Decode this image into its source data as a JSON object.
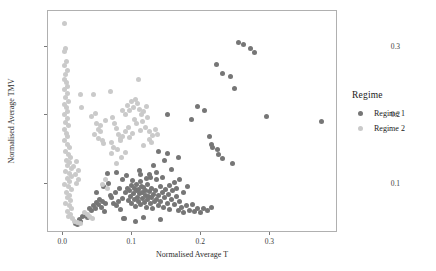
{
  "chart_data": {
    "type": "scatter",
    "title": "",
    "xlabel": "Normalised Average T",
    "ylabel": "Normalised Average TMV",
    "xlim": [
      -0.022,
      0.398
    ],
    "ylim": [
      0.028,
      0.352
    ],
    "xticks": [
      "0.0",
      "0.1",
      "0.2",
      "0.3"
    ],
    "xtick_values": [
      0.0,
      0.1,
      0.2,
      0.3
    ],
    "yticks": [
      "0.1",
      "0.2",
      "0.3"
    ],
    "ytick_values": [
      0.1,
      0.2,
      0.3
    ],
    "grid": false,
    "legend": {
      "title": "Regime",
      "position": "right",
      "entries": [
        {
          "label": "Regime 1",
          "color": "#767676"
        },
        {
          "label": "Regime 2",
          "color": "#cacaca"
        }
      ]
    },
    "series": [
      {
        "name": "Regime 1",
        "color": "#767676",
        "points": [
          [
            0.019,
            0.041
          ],
          [
            0.022,
            0.039
          ],
          [
            0.025,
            0.046
          ],
          [
            0.027,
            0.044
          ],
          [
            0.03,
            0.05
          ],
          [
            0.033,
            0.052
          ],
          [
            0.036,
            0.049
          ],
          [
            0.04,
            0.063
          ],
          [
            0.043,
            0.06
          ],
          [
            0.046,
            0.066
          ],
          [
            0.048,
            0.062
          ],
          [
            0.05,
            0.071
          ],
          [
            0.052,
            0.068
          ],
          [
            0.054,
            0.075
          ],
          [
            0.057,
            0.064
          ],
          [
            0.059,
            0.073
          ],
          [
            0.061,
            0.058
          ],
          [
            0.063,
            0.069
          ],
          [
            0.065,
            0.114
          ],
          [
            0.067,
            0.099
          ],
          [
            0.07,
            0.082
          ],
          [
            0.072,
            0.078
          ],
          [
            0.074,
            0.07
          ],
          [
            0.077,
            0.085
          ],
          [
            0.079,
            0.066
          ],
          [
            0.081,
            0.073
          ],
          [
            0.083,
            0.091
          ],
          [
            0.085,
            0.061
          ],
          [
            0.087,
            0.077
          ],
          [
            0.089,
            0.047
          ],
          [
            0.091,
            0.086
          ],
          [
            0.093,
            0.11
          ],
          [
            0.095,
            0.092
          ],
          [
            0.096,
            0.074
          ],
          [
            0.098,
            0.088
          ],
          [
            0.099,
            0.08
          ],
          [
            0.1,
            0.096
          ],
          [
            0.101,
            0.07
          ],
          [
            0.102,
            0.103
          ],
          [
            0.103,
            0.084
          ],
          [
            0.104,
            0.076
          ],
          [
            0.105,
            0.092
          ],
          [
            0.106,
            0.065
          ],
          [
            0.107,
            0.088
          ],
          [
            0.108,
            0.098
          ],
          [
            0.109,
            0.079
          ],
          [
            0.11,
            0.073
          ],
          [
            0.111,
            0.09
          ],
          [
            0.112,
            0.084
          ],
          [
            0.113,
            0.101
          ],
          [
            0.114,
            0.068
          ],
          [
            0.115,
            0.095
          ],
          [
            0.116,
            0.077
          ],
          [
            0.117,
            0.086
          ],
          [
            0.118,
            0.093
          ],
          [
            0.119,
            0.071
          ],
          [
            0.12,
            0.082
          ],
          [
            0.121,
            0.089
          ],
          [
            0.122,
            0.064
          ],
          [
            0.123,
            0.075
          ],
          [
            0.124,
            0.097
          ],
          [
            0.125,
            0.08
          ],
          [
            0.126,
            0.087
          ],
          [
            0.128,
            0.069
          ],
          [
            0.129,
            0.078
          ],
          [
            0.13,
            0.091
          ],
          [
            0.131,
            0.062
          ],
          [
            0.132,
            0.083
          ],
          [
            0.133,
            0.072
          ],
          [
            0.135,
            0.089
          ],
          [
            0.136,
            0.076
          ],
          [
            0.137,
            0.104
          ],
          [
            0.139,
            0.067
          ],
          [
            0.14,
            0.081
          ],
          [
            0.142,
            0.094
          ],
          [
            0.143,
            0.073
          ],
          [
            0.145,
            0.085
          ],
          [
            0.146,
            0.064
          ],
          [
            0.148,
            0.079
          ],
          [
            0.15,
            0.09
          ],
          [
            0.152,
            0.07
          ],
          [
            0.154,
            0.083
          ],
          [
            0.156,
            0.061
          ],
          [
            0.158,
            0.075
          ],
          [
            0.16,
            0.088
          ],
          [
            0.162,
            0.068
          ],
          [
            0.165,
            0.08
          ],
          [
            0.168,
            0.059
          ],
          [
            0.17,
            0.072
          ],
          [
            0.173,
            0.064
          ],
          [
            0.176,
            0.057
          ],
          [
            0.18,
            0.066
          ],
          [
            0.184,
            0.06
          ],
          [
            0.188,
            0.068
          ],
          [
            0.192,
            0.058
          ],
          [
            0.196,
            0.062
          ],
          [
            0.2,
            0.056
          ],
          [
            0.205,
            0.063
          ],
          [
            0.21,
            0.059
          ],
          [
            0.216,
            0.064
          ],
          [
            0.05,
            0.086
          ],
          [
            0.06,
            0.094
          ],
          [
            0.078,
            0.115
          ],
          [
            0.088,
            0.105
          ],
          [
            0.112,
            0.118
          ],
          [
            0.126,
            0.112
          ],
          [
            0.132,
            0.125
          ],
          [
            0.145,
            0.108
          ],
          [
            0.148,
            0.132
          ],
          [
            0.158,
            0.119
          ],
          [
            0.163,
            0.1
          ],
          [
            0.17,
            0.104
          ],
          [
            0.09,
            0.047
          ],
          [
            0.106,
            0.044
          ],
          [
            0.118,
            0.049
          ],
          [
            0.142,
            0.046
          ],
          [
            0.128,
            0.107
          ],
          [
            0.136,
            0.115
          ],
          [
            0.122,
            0.106
          ],
          [
            0.114,
            0.112
          ],
          [
            0.155,
            0.096
          ],
          [
            0.166,
            0.091
          ],
          [
            0.175,
            0.086
          ],
          [
            0.182,
            0.094
          ],
          [
            0.153,
            0.199
          ],
          [
            0.187,
            0.192
          ],
          [
            0.196,
            0.211
          ],
          [
            0.206,
            0.205
          ],
          [
            0.213,
            0.167
          ],
          [
            0.216,
            0.156
          ],
          [
            0.218,
            0.152
          ],
          [
            0.225,
            0.148
          ],
          [
            0.223,
            0.273
          ],
          [
            0.232,
            0.259
          ],
          [
            0.244,
            0.255
          ],
          [
            0.249,
            0.238
          ],
          [
            0.256,
            0.304
          ],
          [
            0.263,
            0.302
          ],
          [
            0.272,
            0.296
          ],
          [
            0.278,
            0.29
          ],
          [
            0.232,
            0.135
          ],
          [
            0.246,
            0.128
          ],
          [
            0.226,
            0.141
          ],
          [
            0.296,
            0.197
          ],
          [
            0.376,
            0.19
          ],
          [
            0.153,
            0.143
          ],
          [
            0.168,
            0.137
          ],
          [
            0.14,
            0.146
          ]
        ]
      },
      {
        "name": "Regime 2",
        "color": "#cacaca",
        "points": [
          [
            0.004,
            0.333
          ],
          [
            0.005,
            0.296
          ],
          [
            0.003,
            0.291
          ],
          [
            0.006,
            0.277
          ],
          [
            0.004,
            0.271
          ],
          [
            0.007,
            0.264
          ],
          [
            0.005,
            0.258
          ],
          [
            0.003,
            0.251
          ],
          [
            0.006,
            0.246
          ],
          [
            0.008,
            0.241
          ],
          [
            0.004,
            0.236
          ],
          [
            0.007,
            0.23
          ],
          [
            0.005,
            0.224
          ],
          [
            0.009,
            0.219
          ],
          [
            0.003,
            0.214
          ],
          [
            0.006,
            0.209
          ],
          [
            0.008,
            0.204
          ],
          [
            0.004,
            0.199
          ],
          [
            0.007,
            0.194
          ],
          [
            0.005,
            0.188
          ],
          [
            0.009,
            0.183
          ],
          [
            0.003,
            0.178
          ],
          [
            0.006,
            0.172
          ],
          [
            0.008,
            0.167
          ],
          [
            0.004,
            0.161
          ],
          [
            0.007,
            0.156
          ],
          [
            0.01,
            0.151
          ],
          [
            0.005,
            0.146
          ],
          [
            0.009,
            0.141
          ],
          [
            0.012,
            0.137
          ],
          [
            0.006,
            0.133
          ],
          [
            0.011,
            0.129
          ],
          [
            0.008,
            0.125
          ],
          [
            0.014,
            0.121
          ],
          [
            0.005,
            0.117
          ],
          [
            0.01,
            0.113
          ],
          [
            0.013,
            0.109
          ],
          [
            0.007,
            0.106
          ],
          [
            0.011,
            0.102
          ],
          [
            0.004,
            0.098
          ],
          [
            0.009,
            0.094
          ],
          [
            0.013,
            0.09
          ],
          [
            0.006,
            0.086
          ],
          [
            0.011,
            0.082
          ],
          [
            0.008,
            0.078
          ],
          [
            0.012,
            0.074
          ],
          [
            0.005,
            0.07
          ],
          [
            0.01,
            0.066
          ],
          [
            0.014,
            0.062
          ],
          [
            0.007,
            0.058
          ],
          [
            0.012,
            0.054
          ],
          [
            0.009,
            0.05
          ],
          [
            0.015,
            0.047
          ],
          [
            0.018,
            0.044
          ],
          [
            0.022,
            0.042
          ],
          [
            0.026,
            0.04
          ],
          [
            0.017,
            0.124
          ],
          [
            0.02,
            0.131
          ],
          [
            0.023,
            0.118
          ],
          [
            0.019,
            0.112
          ],
          [
            0.024,
            0.105
          ],
          [
            0.021,
            0.099
          ],
          [
            0.026,
            0.228
          ],
          [
            0.028,
            0.21
          ],
          [
            0.045,
            0.228
          ],
          [
            0.048,
            0.201
          ],
          [
            0.05,
            0.186
          ],
          [
            0.052,
            0.178
          ],
          [
            0.055,
            0.174
          ],
          [
            0.047,
            0.17
          ],
          [
            0.053,
            0.165
          ],
          [
            0.058,
            0.161
          ],
          [
            0.06,
            0.157
          ],
          [
            0.056,
            0.183
          ],
          [
            0.062,
            0.191
          ],
          [
            0.042,
            0.196
          ],
          [
            0.07,
            0.233
          ],
          [
            0.073,
            0.195
          ],
          [
            0.076,
            0.187
          ],
          [
            0.079,
            0.179
          ],
          [
            0.082,
            0.171
          ],
          [
            0.085,
            0.164
          ],
          [
            0.071,
            0.158
          ],
          [
            0.074,
            0.152
          ],
          [
            0.088,
            0.206
          ],
          [
            0.091,
            0.199
          ],
          [
            0.094,
            0.213
          ],
          [
            0.097,
            0.205
          ],
          [
            0.1,
            0.218
          ],
          [
            0.103,
            0.21
          ],
          [
            0.106,
            0.222
          ],
          [
            0.109,
            0.215
          ],
          [
            0.112,
            0.207
          ],
          [
            0.115,
            0.199
          ],
          [
            0.104,
            0.192
          ],
          [
            0.108,
            0.186
          ],
          [
            0.096,
            0.18
          ],
          [
            0.092,
            0.174
          ],
          [
            0.088,
            0.168
          ],
          [
            0.084,
            0.162
          ],
          [
            0.098,
            0.166
          ],
          [
            0.102,
            0.172
          ],
          [
            0.117,
            0.189
          ],
          [
            0.12,
            0.181
          ],
          [
            0.113,
            0.176
          ],
          [
            0.124,
            0.195
          ],
          [
            0.127,
            0.175
          ],
          [
            0.131,
            0.169
          ],
          [
            0.111,
            0.25
          ],
          [
            0.118,
            0.204
          ],
          [
            0.122,
            0.211
          ],
          [
            0.135,
            0.177
          ],
          [
            0.138,
            0.171
          ],
          [
            0.126,
            0.163
          ],
          [
            0.13,
            0.158
          ],
          [
            0.118,
            0.154
          ],
          [
            0.062,
            0.105
          ],
          [
            0.058,
            0.098
          ],
          [
            0.066,
            0.092
          ],
          [
            0.078,
            0.128
          ],
          [
            0.04,
            0.05
          ],
          [
            0.044,
            0.048
          ],
          [
            0.036,
            0.053
          ],
          [
            0.032,
            0.056
          ],
          [
            0.072,
            0.143
          ],
          [
            0.08,
            0.149
          ],
          [
            0.086,
            0.137
          ],
          [
            0.092,
            0.144
          ]
        ]
      }
    ]
  }
}
